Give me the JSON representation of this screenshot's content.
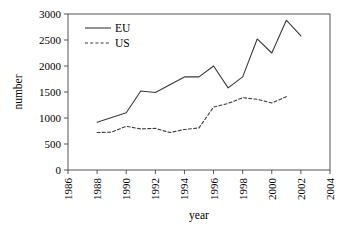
{
  "chart_data": {
    "type": "line",
    "title": "",
    "xlabel": "year",
    "ylabel": "number",
    "xlim": [
      1986,
      2004
    ],
    "ylim": [
      0,
      3000
    ],
    "xticks": [
      1986,
      1988,
      1990,
      1992,
      1994,
      1996,
      1998,
      2000,
      2002,
      2004
    ],
    "yticks": [
      0,
      500,
      1000,
      1500,
      2000,
      2500,
      3000
    ],
    "xtick_labels": [
      "1986",
      "1988",
      "1990",
      "1992",
      "1994",
      "1996",
      "1998",
      "2000",
      "2002",
      "2004"
    ],
    "ytick_labels": [
      "0",
      "500",
      "1000",
      "1500",
      "2000",
      "2500",
      "3000"
    ],
    "xtick_rotation": 90,
    "grid": false,
    "legend_position": "upper left",
    "x": [
      1988,
      1989,
      1990,
      1991,
      1992,
      1993,
      1994,
      1995,
      1996,
      1997,
      1998,
      1999,
      2000,
      2001,
      2002
    ],
    "series": [
      {
        "name": "EU",
        "style": "solid",
        "color": "#3a3a3a",
        "values": [
          920,
          1010,
          1100,
          1520,
          1490,
          1640,
          1790,
          1790,
          2000,
          1580,
          1790,
          2520,
          2250,
          2880,
          2580
        ]
      },
      {
        "name": "US",
        "style": "dashed",
        "color": "#3a3a3a",
        "values": [
          720,
          730,
          840,
          790,
          800,
          720,
          780,
          810,
          1210,
          1280,
          1390,
          1360,
          1290,
          1410,
          null
        ]
      }
    ]
  },
  "axes": {
    "ylabel": "number",
    "xlabel": "year"
  },
  "legend": {
    "entries": [
      {
        "label": "EU",
        "style": "solid"
      },
      {
        "label": "US",
        "style": "dashed"
      }
    ]
  }
}
